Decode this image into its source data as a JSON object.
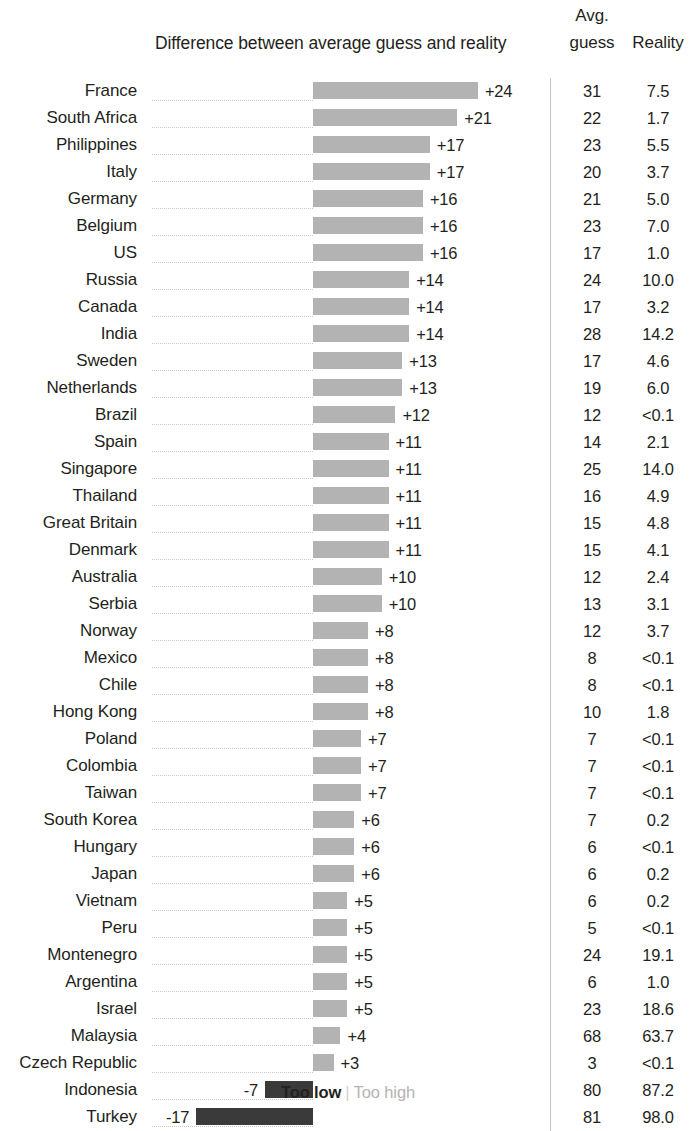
{
  "header": {
    "chart_title": "Difference between average guess and reality",
    "avg_line1": "Avg.",
    "avg_line2": "guess",
    "reality": "Reality"
  },
  "legend": {
    "too_low": "Too low",
    "separator": "|",
    "too_high": "Too high"
  },
  "colors": {
    "positive_bar": "#b3b3b3",
    "negative_bar": "#3a3a3a",
    "text": "#231f20",
    "rule": "#c4c4c4"
  },
  "chart_data": {
    "type": "bar",
    "title": "Difference between average guess and reality",
    "xlabel": "",
    "ylabel": "",
    "orientation": "horizontal",
    "diverging": true,
    "baseline": 0,
    "grid": false,
    "legend_position": "bottom",
    "legend_entries": [
      "Too low",
      "Too high"
    ],
    "columns": [
      "Country",
      "Difference between average guess and reality",
      "Avg. guess",
      "Reality"
    ],
    "categories": [
      "France",
      "South Africa",
      "Philippines",
      "Italy",
      "Germany",
      "Belgium",
      "US",
      "Russia",
      "Canada",
      "India",
      "Sweden",
      "Netherlands",
      "Brazil",
      "Spain",
      "Singapore",
      "Thailand",
      "Great Britain",
      "Denmark",
      "Australia",
      "Serbia",
      "Norway",
      "Mexico",
      "Chile",
      "Hong Kong",
      "Poland",
      "Colombia",
      "Taiwan",
      "South Korea",
      "Hungary",
      "Japan",
      "Vietnam",
      "Peru",
      "Montenegro",
      "Argentina",
      "Israel",
      "Malaysia",
      "Czech Republic",
      "Indonesia",
      "Turkey"
    ],
    "values": [
      24,
      21,
      17,
      17,
      16,
      16,
      16,
      14,
      14,
      14,
      13,
      13,
      12,
      11,
      11,
      11,
      11,
      11,
      10,
      10,
      8,
      8,
      8,
      8,
      7,
      7,
      7,
      6,
      6,
      6,
      5,
      5,
      5,
      5,
      5,
      4,
      3,
      -7,
      -17
    ],
    "xlim": [
      -17,
      24
    ],
    "rows": [
      {
        "country": "France",
        "diff": 24,
        "diff_label": "+24",
        "guess": "31",
        "reality": "7.5"
      },
      {
        "country": "South Africa",
        "diff": 21,
        "diff_label": "+21",
        "guess": "22",
        "reality": "1.7"
      },
      {
        "country": "Philippines",
        "diff": 17,
        "diff_label": "+17",
        "guess": "23",
        "reality": "5.5"
      },
      {
        "country": "Italy",
        "diff": 17,
        "diff_label": "+17",
        "guess": "20",
        "reality": "3.7"
      },
      {
        "country": "Germany",
        "diff": 16,
        "diff_label": "+16",
        "guess": "21",
        "reality": "5.0"
      },
      {
        "country": "Belgium",
        "diff": 16,
        "diff_label": "+16",
        "guess": "23",
        "reality": "7.0"
      },
      {
        "country": "US",
        "diff": 16,
        "diff_label": "+16",
        "guess": "17",
        "reality": "1.0"
      },
      {
        "country": "Russia",
        "diff": 14,
        "diff_label": "+14",
        "guess": "24",
        "reality": "10.0"
      },
      {
        "country": "Canada",
        "diff": 14,
        "diff_label": "+14",
        "guess": "17",
        "reality": "3.2"
      },
      {
        "country": "India",
        "diff": 14,
        "diff_label": "+14",
        "guess": "28",
        "reality": "14.2"
      },
      {
        "country": "Sweden",
        "diff": 13,
        "diff_label": "+13",
        "guess": "17",
        "reality": "4.6"
      },
      {
        "country": "Netherlands",
        "diff": 13,
        "diff_label": "+13",
        "guess": "19",
        "reality": "6.0"
      },
      {
        "country": "Brazil",
        "diff": 12,
        "diff_label": "+12",
        "guess": "12",
        "reality": "<0.1"
      },
      {
        "country": "Spain",
        "diff": 11,
        "diff_label": "+11",
        "guess": "14",
        "reality": "2.1"
      },
      {
        "country": "Singapore",
        "diff": 11,
        "diff_label": "+11",
        "guess": "25",
        "reality": "14.0"
      },
      {
        "country": "Thailand",
        "diff": 11,
        "diff_label": "+11",
        "guess": "16",
        "reality": "4.9"
      },
      {
        "country": "Great Britain",
        "diff": 11,
        "diff_label": "+11",
        "guess": "15",
        "reality": "4.8"
      },
      {
        "country": "Denmark",
        "diff": 11,
        "diff_label": "+11",
        "guess": "15",
        "reality": "4.1"
      },
      {
        "country": "Australia",
        "diff": 10,
        "diff_label": "+10",
        "guess": "12",
        "reality": "2.4"
      },
      {
        "country": "Serbia",
        "diff": 10,
        "diff_label": "+10",
        "guess": "13",
        "reality": "3.1"
      },
      {
        "country": "Norway",
        "diff": 8,
        "diff_label": "+8",
        "guess": "12",
        "reality": "3.7"
      },
      {
        "country": "Mexico",
        "diff": 8,
        "diff_label": "+8",
        "guess": "8",
        "reality": "<0.1"
      },
      {
        "country": "Chile",
        "diff": 8,
        "diff_label": "+8",
        "guess": "8",
        "reality": "<0.1"
      },
      {
        "country": "Hong Kong",
        "diff": 8,
        "diff_label": "+8",
        "guess": "10",
        "reality": "1.8"
      },
      {
        "country": "Poland",
        "diff": 7,
        "diff_label": "+7",
        "guess": "7",
        "reality": "<0.1"
      },
      {
        "country": "Colombia",
        "diff": 7,
        "diff_label": "+7",
        "guess": "7",
        "reality": "<0.1"
      },
      {
        "country": "Taiwan",
        "diff": 7,
        "diff_label": "+7",
        "guess": "7",
        "reality": "<0.1"
      },
      {
        "country": "South Korea",
        "diff": 6,
        "diff_label": "+6",
        "guess": "7",
        "reality": "0.2"
      },
      {
        "country": "Hungary",
        "diff": 6,
        "diff_label": "+6",
        "guess": "6",
        "reality": "<0.1"
      },
      {
        "country": "Japan",
        "diff": 6,
        "diff_label": "+6",
        "guess": "6",
        "reality": "0.2"
      },
      {
        "country": "Vietnam",
        "diff": 5,
        "diff_label": "+5",
        "guess": "6",
        "reality": "0.2"
      },
      {
        "country": "Peru",
        "diff": 5,
        "diff_label": "+5",
        "guess": "5",
        "reality": "<0.1"
      },
      {
        "country": "Montenegro",
        "diff": 5,
        "diff_label": "+5",
        "guess": "24",
        "reality": "19.1"
      },
      {
        "country": "Argentina",
        "diff": 5,
        "diff_label": "+5",
        "guess": "6",
        "reality": "1.0"
      },
      {
        "country": "Israel",
        "diff": 5,
        "diff_label": "+5",
        "guess": "23",
        "reality": "18.6"
      },
      {
        "country": "Malaysia",
        "diff": 4,
        "diff_label": "+4",
        "guess": "68",
        "reality": "63.7"
      },
      {
        "country": "Czech Republic",
        "diff": 3,
        "diff_label": "+3",
        "guess": "3",
        "reality": "<0.1"
      },
      {
        "country": "Indonesia",
        "diff": -7,
        "diff_label": "-7",
        "guess": "80",
        "reality": "87.2"
      },
      {
        "country": "Turkey",
        "diff": -17,
        "diff_label": "-17",
        "guess": "81",
        "reality": "98.0"
      }
    ]
  }
}
